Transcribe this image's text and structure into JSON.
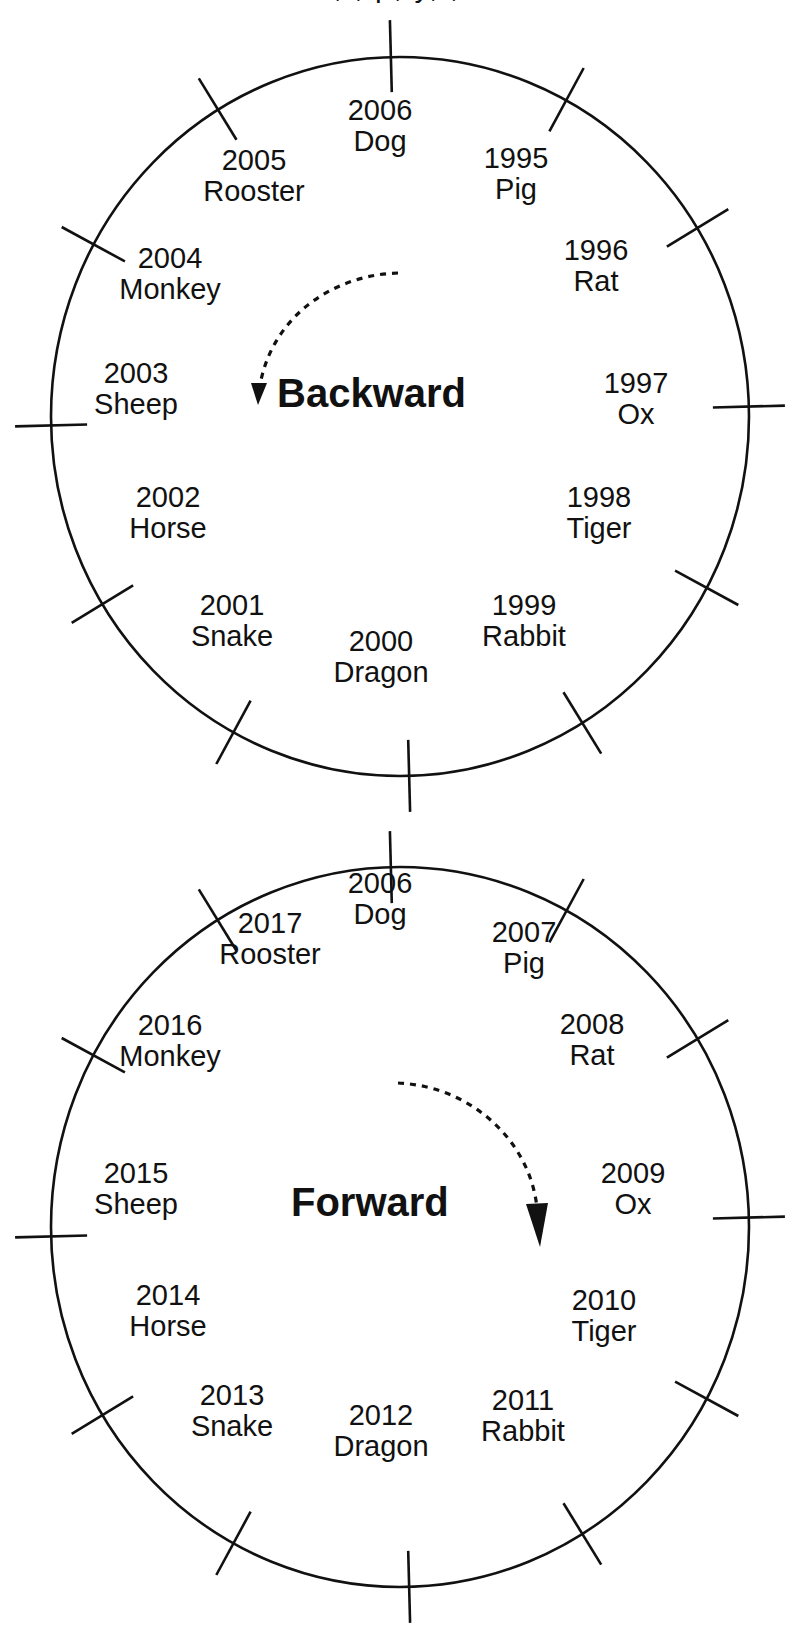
{
  "page": {
    "top_cropped_text_fragment": ", , p, y, ,"
  },
  "colors": {
    "ink": "#111111",
    "background": "#ffffff"
  },
  "diagrams": [
    {
      "id": "backward",
      "direction_label": "Backward",
      "arrow": {
        "direction": "counterclockwise",
        "style": "dotted-curved-arrow",
        "arrow_icon": "curved-dotted-arrow-down-left-icon"
      },
      "circle": {
        "cx": 400,
        "cy": 416,
        "rx": 349,
        "ry": 360
      },
      "segments": [
        {
          "year": "2006",
          "animal": "Dog"
        },
        {
          "year": "1995",
          "animal": "Pig"
        },
        {
          "year": "1996",
          "animal": "Rat"
        },
        {
          "year": "1997",
          "animal": "Ox"
        },
        {
          "year": "1998",
          "animal": "Tiger"
        },
        {
          "year": "1999",
          "animal": "Rabbit"
        },
        {
          "year": "2000",
          "animal": "Dragon"
        },
        {
          "year": "2001",
          "animal": "Snake"
        },
        {
          "year": "2002",
          "animal": "Horse"
        },
        {
          "year": "2003",
          "animal": "Sheep"
        },
        {
          "year": "2004",
          "animal": "Monkey"
        },
        {
          "year": "2005",
          "animal": "Rooster"
        }
      ]
    },
    {
      "id": "forward",
      "direction_label": "Forward",
      "arrow": {
        "direction": "clockwise",
        "style": "dotted-curved-arrow",
        "arrow_icon": "curved-dotted-arrow-down-right-icon"
      },
      "circle": {
        "cx": 400,
        "cy": 1227,
        "rx": 349,
        "ry": 360
      },
      "segments": [
        {
          "year": "2006",
          "animal": "Dog"
        },
        {
          "year": "2007",
          "animal": "Pig"
        },
        {
          "year": "2008",
          "animal": "Rat"
        },
        {
          "year": "2009",
          "animal": "Ox"
        },
        {
          "year": "2010",
          "animal": "Tiger"
        },
        {
          "year": "2011",
          "animal": "Rabbit"
        },
        {
          "year": "2012",
          "animal": "Dragon"
        },
        {
          "year": "2013",
          "animal": "Snake"
        },
        {
          "year": "2014",
          "animal": "Horse"
        },
        {
          "year": "2015",
          "animal": "Sheep"
        },
        {
          "year": "2016",
          "animal": "Monkey"
        },
        {
          "year": "2017",
          "animal": "Rooster"
        }
      ]
    }
  ]
}
